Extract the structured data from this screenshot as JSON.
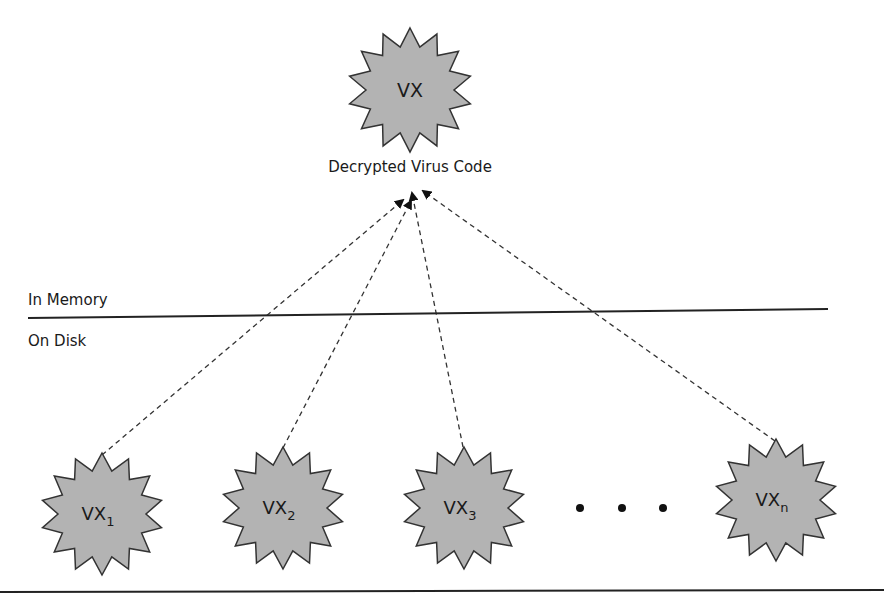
{
  "top_node": {
    "label": "VX",
    "caption": "Decrypted Virus Code",
    "cx": 410,
    "cy": 90,
    "r_outer": 62,
    "r_inner": 44
  },
  "regions": {
    "upper_label": "In Memory",
    "lower_label": "On Disk"
  },
  "disk_nodes": [
    {
      "base": "VX",
      "sub": "1",
      "cx": 102,
      "cy": 514,
      "anchor": [
        102,
        455
      ]
    },
    {
      "base": "VX",
      "sub": "2",
      "cx": 283,
      "cy": 508,
      "anchor": [
        283,
        448
      ]
    },
    {
      "base": "VX",
      "sub": "3",
      "cx": 464,
      "cy": 508,
      "anchor": [
        463,
        447
      ]
    },
    {
      "base": "VX",
      "sub": "n",
      "cx": 776,
      "cy": 500,
      "anchor": [
        775,
        441
      ]
    }
  ],
  "ellipsis_dots": [
    [
      580,
      508
    ],
    [
      622,
      508
    ],
    [
      663,
      508
    ]
  ],
  "arrow_targets": [
    [
      403,
      200
    ],
    [
      411,
      201
    ],
    [
      412,
      193
    ],
    [
      423,
      191
    ]
  ],
  "colors": {
    "star_fill": "#b3b3b3",
    "star_stroke": "#333333",
    "line": "#222222"
  }
}
